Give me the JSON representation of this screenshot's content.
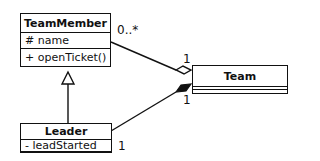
{
  "diagram": {
    "type": "UML class diagram",
    "classes": [
      {
        "name": "TeamMember",
        "attributes": [
          "# name"
        ],
        "operations": [
          "+ openTicket()"
        ]
      },
      {
        "name": "Leader",
        "attributes": [
          "- leadStarted"
        ],
        "operations": []
      },
      {
        "name": "Team",
        "attributes": [],
        "operations": []
      }
    ],
    "relationships": [
      {
        "type": "aggregation",
        "from": "TeamMember",
        "to": "Team",
        "multiplicity_from": "0..*",
        "multiplicity_to": "1"
      },
      {
        "type": "composition",
        "from": "Leader",
        "to": "Team",
        "multiplicity_from": "1",
        "multiplicity_to": "1"
      },
      {
        "type": "generalization",
        "from": "Leader",
        "to": "TeamMember"
      }
    ]
  },
  "labels": {
    "tm_name": "TeamMember",
    "tm_attr": "# name",
    "tm_op": "+ openTicket()",
    "leader_name": "Leader",
    "leader_attr": "- leadStarted",
    "team_name": "Team",
    "mult_tm": "0..*",
    "mult_team_agg": "1",
    "mult_team_comp": "1",
    "mult_leader": "1"
  }
}
